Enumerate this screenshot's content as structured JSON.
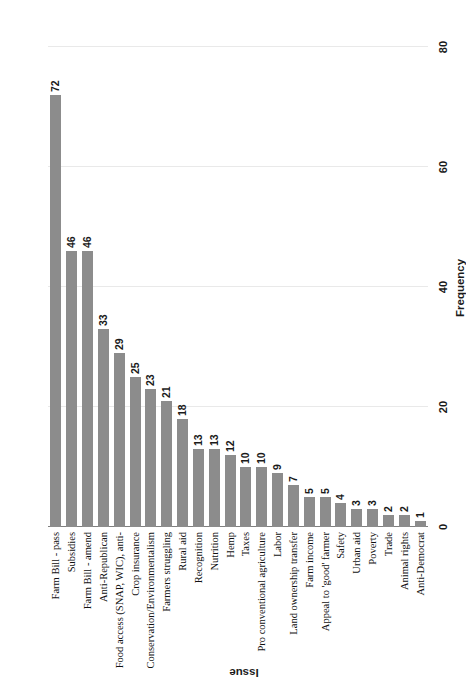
{
  "chart_data": {
    "type": "bar",
    "orientation": "vertical",
    "title": "",
    "xlabel": "Issue",
    "ylabel": "Frequency",
    "ylim": [
      0,
      80
    ],
    "yticks": [
      0,
      20,
      40,
      60,
      80
    ],
    "grid": true,
    "legend": false,
    "bar_color": "#8c8c8c",
    "gridline_color": "#e9e9e9",
    "axis_color": "#7f7f7f",
    "data_labels": true,
    "categories": [
      "Farm Bill - pass",
      "Subsidies",
      "Farm Bill - amend",
      "Anti-Republican",
      "Food access (SNAP, WIC), anti-",
      "Crop insurance",
      "Conservation/Environmentalism",
      "Farmers struggling",
      "Rural aid",
      "Recognition",
      "Nutrition",
      "Hemp",
      "Taxes",
      "Pro conventional agriculture",
      "Labor",
      "Land ownership transfer",
      "Farm income",
      "Appeal to 'good' farmer",
      "Safety",
      "Urban aid",
      "Poverty",
      "Trade",
      "Animal rights",
      "Anti-Democrat"
    ],
    "values": [
      72,
      46,
      46,
      33,
      29,
      25,
      23,
      21,
      18,
      13,
      13,
      12,
      10,
      10,
      9,
      7,
      5,
      5,
      4,
      3,
      3,
      2,
      2,
      1
    ]
  }
}
